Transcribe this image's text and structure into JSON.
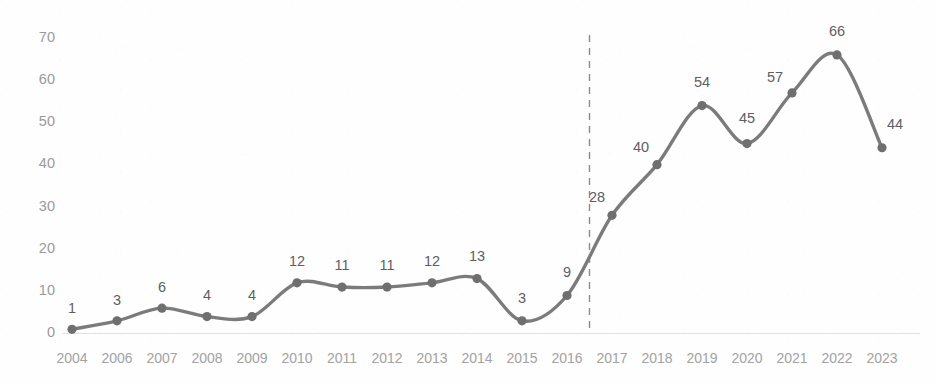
{
  "chart_data": {
    "type": "line",
    "title": "",
    "subtitle": "",
    "xlabel": "",
    "ylabel": "",
    "categories": [
      "2004",
      "2006",
      "2007",
      "2008",
      "2009",
      "2010",
      "2011",
      "2012",
      "2013",
      "2014",
      "2015",
      "2016",
      "2017",
      "2018",
      "2019",
      "2020",
      "2021",
      "2022",
      "2023"
    ],
    "values": [
      1,
      3,
      6,
      4,
      4,
      12,
      11,
      11,
      12,
      13,
      3,
      9,
      28,
      40,
      54,
      45,
      57,
      66,
      44
    ],
    "series": [
      {
        "name": "",
        "values": [
          1,
          3,
          6,
          4,
          4,
          12,
          11,
          11,
          12,
          13,
          3,
          9,
          28,
          40,
          54,
          45,
          57,
          66,
          44
        ]
      }
    ],
    "data_labels": [
      "1",
      "3",
      "6",
      "4",
      "4",
      "12",
      "11",
      "11",
      "12",
      "13",
      "3",
      "9",
      "28",
      "40",
      "54",
      "45",
      "57",
      "66",
      "44"
    ],
    "ylim": [
      0,
      70
    ],
    "yticks": [
      0,
      10,
      20,
      30,
      40,
      50,
      60,
      70
    ],
    "ytick_labels": [
      "0",
      "10",
      "20",
      "30",
      "40",
      "50",
      "60",
      "70"
    ],
    "grid": false,
    "legend": "none",
    "annotations": [
      {
        "name": "vertical-dashed-divider",
        "type": "vline",
        "between": [
          "2016",
          "2017"
        ],
        "style": "dashed"
      }
    ],
    "colors": {
      "line": "#7b7b7b",
      "marker": "#6f6f6f",
      "data_label": "#5e5e5e",
      "axis_label": "#a2a2a2",
      "baseline": "#e2e2e2",
      "divider": "#8a8a8a",
      "background": "#fefefe"
    }
  }
}
